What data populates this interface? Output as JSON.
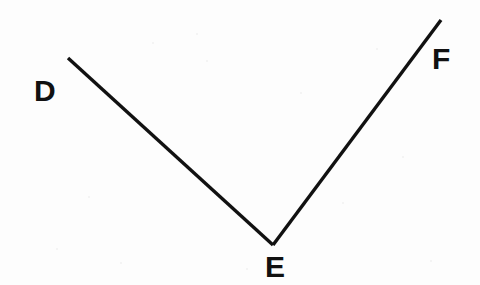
{
  "figure": {
    "name": "angle-def",
    "background_color": "#fdfdfd",
    "stroke_color": "#111111",
    "stroke_width": 3.4,
    "label_color": "#111111",
    "labels": [
      {
        "id": "D",
        "text": "D",
        "x": 34,
        "y": 76
      },
      {
        "id": "E",
        "text": "E",
        "x": 265,
        "y": 252
      },
      {
        "id": "F",
        "text": "F",
        "x": 432,
        "y": 44
      }
    ],
    "points": {
      "D": {
        "x": 68,
        "y": 58
      },
      "E": {
        "x": 273,
        "y": 245
      },
      "F": {
        "x": 441,
        "y": 20
      }
    },
    "rays": [
      {
        "name": "ray-ed",
        "from": "E",
        "to": "D",
        "path": "M 68 58 L 273 245"
      },
      {
        "name": "ray-ef",
        "from": "E",
        "to": "F",
        "path": "M 273 245 L 441 20"
      }
    ],
    "specks": [
      {
        "x": 152,
        "y": 42,
        "size": 2
      },
      {
        "x": 196,
        "y": 33,
        "size": 2
      },
      {
        "x": 206,
        "y": 60,
        "size": 2
      },
      {
        "x": 88,
        "y": 196,
        "size": 2
      },
      {
        "x": 300,
        "y": 92,
        "size": 2
      },
      {
        "x": 342,
        "y": 202,
        "size": 2
      },
      {
        "x": 402,
        "y": 156,
        "size": 2
      },
      {
        "x": 56,
        "y": 248,
        "size": 2
      },
      {
        "x": 246,
        "y": 268,
        "size": 2
      },
      {
        "x": 430,
        "y": 260,
        "size": 2
      },
      {
        "x": 120,
        "y": 262,
        "size": 2
      },
      {
        "x": 376,
        "y": 48,
        "size": 2
      }
    ]
  }
}
